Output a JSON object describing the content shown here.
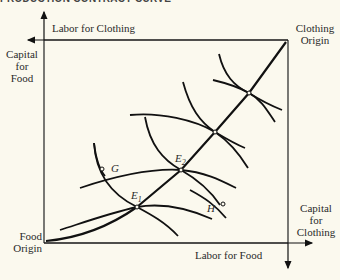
{
  "header": {
    "title": "PRODUCTION CONTRACT CURVE"
  },
  "axes": {
    "top": "Labor for Clothing",
    "bottom": "Labor for Food",
    "left_line1": "Capital",
    "left_line2": "for",
    "left_line3": "Food",
    "right_line1": "Capital",
    "right_line2": "for",
    "right_line3": "Clothing"
  },
  "origins": {
    "clothing_line1": "Clothing",
    "clothing_line2": "Origin",
    "food_line1": "Food",
    "food_line2": "Origin"
  },
  "points": {
    "G": "G",
    "H": "H",
    "E1": "E",
    "E1_sub": "1",
    "E2": "E",
    "E2_sub": "2"
  },
  "colors": {
    "background": "#fbf9ee",
    "ink": "#111111"
  }
}
